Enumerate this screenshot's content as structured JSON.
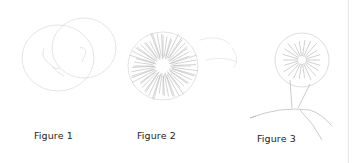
{
  "figures": [
    {
      "caption": "Figure 1",
      "subject": "faint pencil sketch of overlapping circular shapes"
    },
    {
      "caption": "Figure 2",
      "subject": "radial spiky flower sketch"
    },
    {
      "caption": "Figure 3",
      "subject": "flower head on branching stem sketch"
    }
  ],
  "colors": {
    "sketch": "#bdbdbd",
    "sketch_dark": "#9a9a9a",
    "caption": "#222222",
    "rule": "#e6e6e6"
  }
}
